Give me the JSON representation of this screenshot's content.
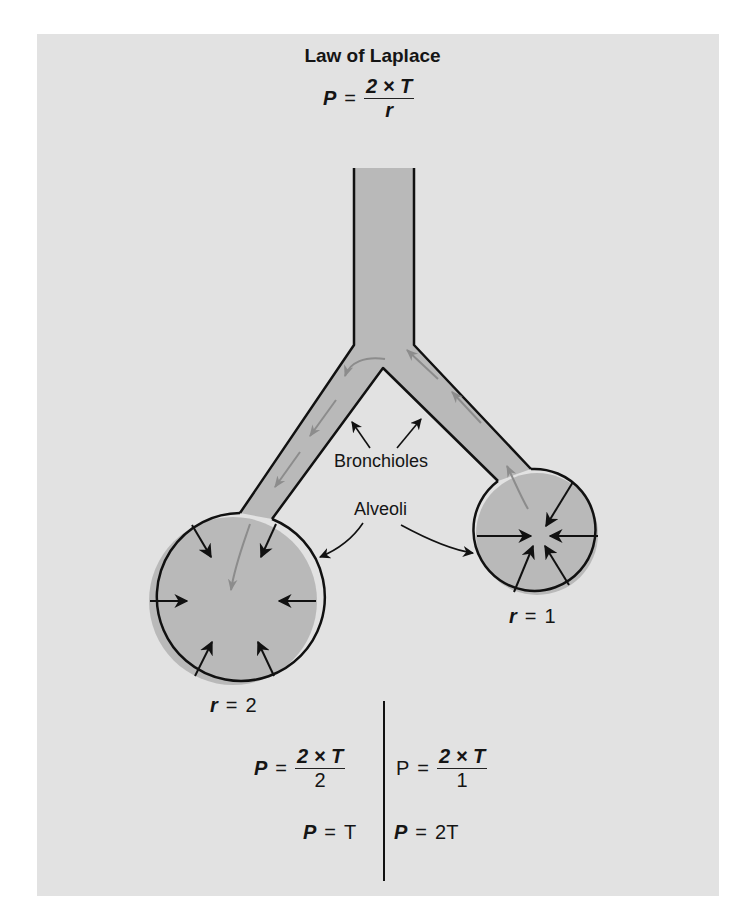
{
  "figure": {
    "title": "Law of Laplace",
    "main_formula": {
      "lhs": "P",
      "eq": "=",
      "numerator": "2 × T",
      "denominator": "r"
    },
    "labels": {
      "bronchioles": "Bronchioles",
      "alveoli": "Alveoli",
      "large_radius": {
        "var": "r",
        "eq": "=",
        "value": "2"
      },
      "small_radius": {
        "var": "r",
        "eq": "=",
        "value": "1"
      }
    },
    "left_calc": {
      "formula": {
        "lhs": "P",
        "eq": "=",
        "numerator": "2 × T",
        "denominator": "2"
      },
      "result": {
        "lhs": "P",
        "eq": "=",
        "value": "T"
      }
    },
    "right_calc": {
      "formula": {
        "lhs": "P",
        "eq": "=",
        "numerator": "2 × T",
        "denominator": "1"
      },
      "result": {
        "lhs": "P",
        "eq": "=",
        "value": "2T"
      }
    },
    "colors": {
      "background_panel": "#e2e2e2",
      "airway_fill": "#b9b9b9",
      "outline": "#111111",
      "airflow_arrow": "#8c8c8c"
    }
  }
}
